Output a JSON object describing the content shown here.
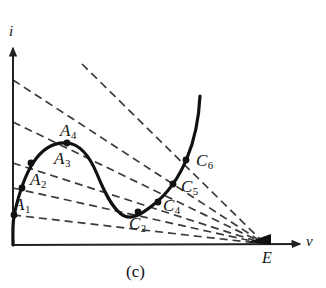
{
  "figure": {
    "caption": "(c)",
    "type": "iv-characteristic-with-load-lines",
    "background_color": "#ffffff",
    "curve_color": "#111111",
    "loadline_color": "#3b3b3b",
    "axis_color": "#222222"
  },
  "axes": {
    "x_label": "v",
    "y_label": "i",
    "origin_px": [
      13,
      245
    ],
    "x_axis_end_px": [
      300,
      244
    ],
    "y_axis_end_px": [
      13,
      48
    ]
  },
  "source_point": {
    "label": "E",
    "px": [
      265,
      244
    ],
    "description": "common convergence point of all dashed load lines on the v-axis"
  },
  "operating_points": [
    {
      "label": "A",
      "sub": "1",
      "px": [
        14,
        215
      ],
      "branch": "left"
    },
    {
      "label": "A",
      "sub": "2",
      "px": [
        22,
        188
      ],
      "branch": "left"
    },
    {
      "label": "A",
      "sub": "3",
      "px": [
        31,
        163
      ],
      "branch": "left"
    },
    {
      "label": "A",
      "sub": "4",
      "px": [
        67,
        143
      ],
      "branch": "peak"
    },
    {
      "label": "C",
      "sub": "2",
      "px": [
        138,
        212
      ],
      "branch": "right"
    },
    {
      "label": "C",
      "sub": "4",
      "px": [
        158,
        202
      ],
      "branch": "right"
    },
    {
      "label": "C",
      "sub": "5",
      "px": [
        173,
        184
      ],
      "branch": "right"
    },
    {
      "label": "C",
      "sub": "6",
      "px": [
        186,
        160
      ],
      "branch": "right"
    }
  ],
  "point_labels": [
    {
      "id": "A1",
      "text": "A",
      "sub": "1",
      "x": 14,
      "y": 196
    },
    {
      "id": "A2",
      "text": "A",
      "sub": "2",
      "x": 30,
      "y": 171
    },
    {
      "id": "A3",
      "text": "A",
      "sub": "3",
      "x": 54,
      "y": 150
    },
    {
      "id": "A4",
      "text": "A",
      "sub": "4",
      "x": 60,
      "y": 122
    },
    {
      "id": "C2",
      "text": "C",
      "sub": "2",
      "x": 129,
      "y": 215
    },
    {
      "id": "C4",
      "text": "C",
      "sub": "4",
      "x": 163,
      "y": 197
    },
    {
      "id": "C5",
      "text": "C",
      "sub": "5",
      "x": 181,
      "y": 178
    },
    {
      "id": "C6",
      "text": "C",
      "sub": "6",
      "x": 196,
      "y": 152
    }
  ],
  "load_lines": [
    {
      "id": "line-1",
      "from_px": [
        13,
        215
      ],
      "to_px": [
        265,
        244
      ],
      "passes": [
        "A1",
        "C2"
      ]
    },
    {
      "id": "line-2",
      "from_px": [
        13,
        188
      ],
      "to_px": [
        265,
        244
      ],
      "passes": [
        "A2",
        "C4"
      ]
    },
    {
      "id": "line-3",
      "from_px": [
        13,
        163
      ],
      "to_px": [
        265,
        244
      ],
      "passes": [
        "A3",
        "C5"
      ]
    },
    {
      "id": "line-4",
      "from_px": [
        13,
        122
      ],
      "to_px": [
        265,
        244
      ],
      "passes": []
    },
    {
      "id": "line-5",
      "from_px": [
        13,
        80
      ],
      "to_px": [
        265,
        244
      ],
      "passes": []
    },
    {
      "id": "line-6",
      "from_px": [
        82,
        64
      ],
      "to_px": [
        265,
        244
      ],
      "passes": [
        "A4",
        "C6"
      ]
    }
  ],
  "curve": {
    "description": "N-shaped negative-differential-resistance i-v characteristic",
    "path_px": "M 13,245 C 13,232 12,222 15,211 C 19,194 24,177 33,163 C 42,149 54,142 67,143 C 80,144 90,157 97,174 C 104,191 111,206 121,214 C 131,222 143,213 153,205 C 166,195 178,180 187,158 C 195,139 199,116 200,96",
    "peak_px": [
      67,
      143
    ],
    "valley_px": [
      121,
      215
    ],
    "top_end_px": [
      200,
      96
    ]
  }
}
